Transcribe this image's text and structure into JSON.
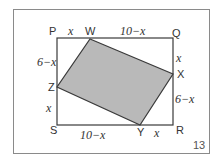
{
  "figure": {
    "number": "13",
    "colors": {
      "frame": "#8a8a8a",
      "lines": "#3a3a3a",
      "fill": "#b9b9b9",
      "background": "#ffffff"
    },
    "rectangle": {
      "vertices": [
        "P",
        "Q",
        "R",
        "S"
      ]
    },
    "inner_quadrilateral": {
      "vertices": [
        "W",
        "X",
        "Y",
        "Z"
      ],
      "shaded": true
    },
    "points": {
      "P": "P",
      "Q": "Q",
      "R": "R",
      "S": "S",
      "W": "W",
      "X": "X",
      "Y": "Y",
      "Z": "Z"
    },
    "segment_labels": {
      "PW": "x",
      "WQ": "10−x",
      "QX": "x",
      "XR": "6−x",
      "RY": "x",
      "YS": "10−x",
      "SZ": "x",
      "ZP": "6−x"
    }
  }
}
